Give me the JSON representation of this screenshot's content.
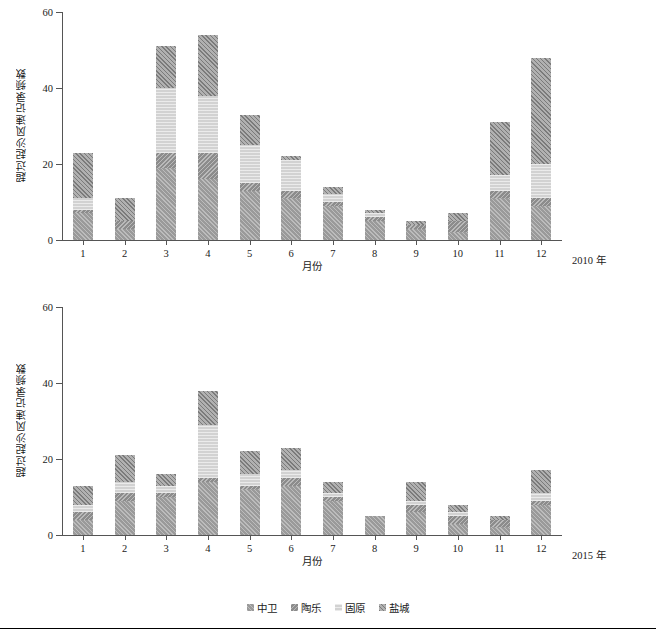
{
  "legend": {
    "position": "bottom-center",
    "items": [
      {
        "label": "中卫",
        "color": "#9a9a9a"
      },
      {
        "label": "陶乐",
        "color": "#8c8c8c"
      },
      {
        "label": "固原",
        "color": "#d2d2d2"
      },
      {
        "label": "盐城",
        "color": "#8f8f8f"
      }
    ]
  },
  "panels": [
    {
      "id": "panel-2010",
      "year_label": "2010 年",
      "ylabel": "超过起沙风速记录频数",
      "xlabel": "月份",
      "yticks": [
        "0",
        "20",
        "40",
        "60"
      ]
    },
    {
      "id": "panel-2015",
      "year_label": "2015 年",
      "ylabel": "超过起沙风速记录频数",
      "xlabel": "月份",
      "yticks": [
        "0",
        "20",
        "40",
        "60"
      ]
    }
  ],
  "chart_data": [
    {
      "type": "bar",
      "stacked": true,
      "title": "",
      "subtitle": "2010 年",
      "xlabel": "月份",
      "ylabel": "超过起沙风速记录频数",
      "ylim": [
        0,
        60
      ],
      "yticks": [
        0,
        20,
        40,
        60
      ],
      "grid": false,
      "categories": [
        "1",
        "2",
        "3",
        "4",
        "5",
        "6",
        "7",
        "8",
        "9",
        "10",
        "11",
        "12"
      ],
      "series": [
        {
          "name": "中卫",
          "color": "#9a9a9a",
          "values": [
            7,
            3,
            19,
            16,
            13,
            11,
            9,
            5,
            3,
            2,
            11,
            9
          ]
        },
        {
          "name": "陶乐",
          "color": "#8c8c8c",
          "values": [
            1,
            2,
            4,
            7,
            2,
            2,
            1,
            1,
            1,
            3,
            2,
            2
          ]
        },
        {
          "name": "固原",
          "color": "#d2d2d2",
          "values": [
            3,
            0,
            17,
            15,
            10,
            8,
            2,
            1,
            0,
            0,
            4,
            9
          ]
        },
        {
          "name": "盐城",
          "color": "#8f8f8f",
          "values": [
            12,
            6,
            11,
            16,
            8,
            1,
            2,
            1,
            1,
            2,
            14,
            28
          ]
        }
      ],
      "totals": [
        23,
        11,
        51,
        54,
        33,
        22,
        14,
        8,
        5,
        7,
        31,
        48
      ]
    },
    {
      "type": "bar",
      "stacked": true,
      "title": "",
      "subtitle": "2015 年",
      "xlabel": "月份",
      "ylabel": "超过起沙风速记录频数",
      "ylim": [
        0,
        60
      ],
      "yticks": [
        0,
        20,
        40,
        60
      ],
      "grid": false,
      "categories": [
        "1",
        "2",
        "3",
        "4",
        "5",
        "6",
        "7",
        "8",
        "9",
        "10",
        "11",
        "12"
      ],
      "series": [
        {
          "name": "中卫",
          "color": "#9a9a9a",
          "values": [
            4,
            9,
            10,
            14,
            12,
            13,
            9,
            5,
            6,
            3,
            2,
            8
          ]
        },
        {
          "name": "陶乐",
          "color": "#8c8c8c",
          "values": [
            2,
            2,
            1,
            1,
            1,
            2,
            1,
            0,
            2,
            2,
            2,
            1
          ]
        },
        {
          "name": "固原",
          "color": "#d2d2d2",
          "values": [
            2,
            3,
            2,
            14,
            3,
            2,
            1,
            0,
            1,
            1,
            0,
            2
          ]
        },
        {
          "name": "盐城",
          "color": "#8f8f8f",
          "values": [
            5,
            7,
            3,
            9,
            6,
            6,
            3,
            0,
            5,
            2,
            1,
            6
          ]
        }
      ],
      "totals": [
        13,
        21,
        16,
        38,
        22,
        23,
        14,
        5,
        14,
        8,
        5,
        17
      ]
    }
  ]
}
